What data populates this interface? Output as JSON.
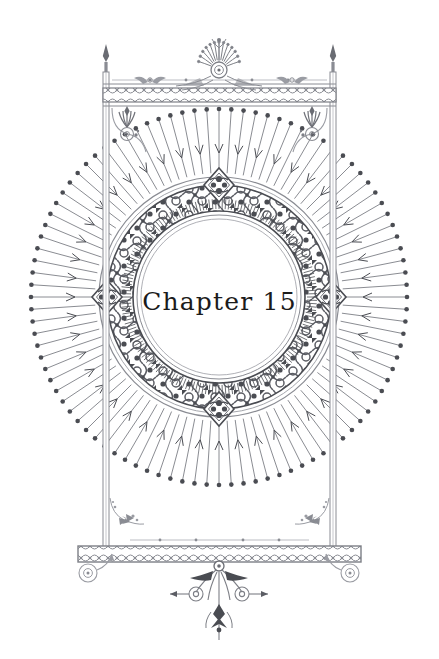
{
  "page": {
    "width": 439,
    "height": 659,
    "background_color": "#ffffff",
    "kind": "decorative-chapter-title-page"
  },
  "title": {
    "text": "Chapter 15",
    "chapter_word": "Chapter",
    "chapter_number": "15",
    "color": "#1b1b1b",
    "align": "center"
  },
  "ornament": {
    "ink_color": "#7d7f86",
    "ink_color_dark": "#4a4c52",
    "ink_color_light": "#a9abb2",
    "frame": {
      "name": "rectangular-banner-frame",
      "left": 103,
      "right": 336,
      "top": 78,
      "bottom": 548,
      "rail_color": "#8a8c93",
      "top_band_pattern": "guilloche-interlace",
      "bottom_band_pattern": "guilloche-interlace",
      "post_finial": "spear-point",
      "corner_flourish": "scroll-spiral-with-palmette",
      "bottom_corner_flourish": "floral-spray"
    },
    "crest": {
      "name": "top-center-palmette-crest",
      "center_x": 219,
      "center_y": 68,
      "motif": "anthemion-fan-with-rosette"
    },
    "pendant": {
      "name": "bottom-center-pendant",
      "center_x": 219,
      "top_y": 563,
      "motif": "scrolled-drop-finial"
    },
    "feet": {
      "name": "bottom-bar-volute-feet",
      "motif": "spiral-volute",
      "left_x": 88,
      "right_x": 350
    },
    "medallion": {
      "name": "central-filigree-medallion",
      "center_x": 219,
      "center_y": 297,
      "inner_radius": 78,
      "band_inner_radius": 86,
      "band_outer_radius": 112,
      "outer_ring_radius": 120,
      "cartouches": [
        "top",
        "bottom",
        "left",
        "right"
      ],
      "cartouche_motif": "scroll-shield"
    },
    "sunburst": {
      "name": "radiating-ray-halo",
      "center_x": 219,
      "center_y": 297,
      "inner_radius": 124,
      "outer_radius": 188,
      "ray_count": 96,
      "ray_tip": "ball-terminal",
      "alternate_ray_tip": "arrow-barb"
    }
  }
}
